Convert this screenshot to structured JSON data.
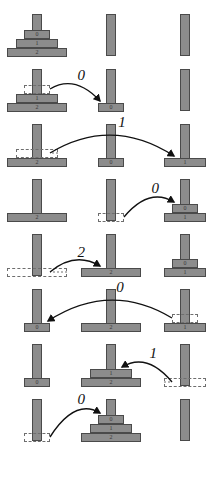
{
  "figure": {
    "peg_count": 3,
    "disc_count": 3,
    "disc_labels": [
      "0",
      "1",
      "2"
    ],
    "colors": {
      "disc_fill": "#8c8c8c",
      "disc_stroke": "#4a4a4a",
      "ghost_stroke": "#6e6e6e",
      "arrow": "#111111",
      "background": "#ffffff"
    }
  },
  "steps": [
    {
      "index": 0,
      "move_label": "",
      "pegs": [
        [
          "2",
          "1",
          "0"
        ],
        [],
        []
      ],
      "ghost": null,
      "arrow": null
    },
    {
      "index": 1,
      "move_label": "0",
      "pegs": [
        [
          "2",
          "1"
        ],
        [
          "0"
        ],
        []
      ],
      "ghost": {
        "peg": 0,
        "disc": "0",
        "level": 2
      },
      "arrow": {
        "from_peg": 0,
        "to_peg": 1,
        "label": "0"
      }
    },
    {
      "index": 2,
      "move_label": "1",
      "pegs": [
        [
          "2"
        ],
        [
          "0"
        ],
        [
          "1"
        ]
      ],
      "ghost": {
        "peg": 0,
        "disc": "1",
        "level": 1
      },
      "arrow": {
        "from_peg": 0,
        "to_peg": 2,
        "label": "1"
      }
    },
    {
      "index": 3,
      "move_label": "0",
      "pegs": [
        [
          "2"
        ],
        [],
        [
          "1",
          "0"
        ]
      ],
      "ghost": {
        "peg": 1,
        "disc": "0",
        "level": 0
      },
      "arrow": {
        "from_peg": 1,
        "to_peg": 2,
        "label": "0"
      }
    },
    {
      "index": 4,
      "move_label": "2",
      "pegs": [
        [],
        [
          "2"
        ],
        [
          "1",
          "0"
        ]
      ],
      "ghost": {
        "peg": 0,
        "disc": "2",
        "level": 0
      },
      "arrow": {
        "from_peg": 0,
        "to_peg": 1,
        "label": "2"
      }
    },
    {
      "index": 5,
      "move_label": "0",
      "pegs": [
        [
          "0"
        ],
        [
          "2"
        ],
        [
          "1"
        ]
      ],
      "ghost": {
        "peg": 2,
        "disc": "0",
        "level": 1
      },
      "arrow": {
        "from_peg": 2,
        "to_peg": 0,
        "label": "0"
      }
    },
    {
      "index": 6,
      "move_label": "1",
      "pegs": [
        [
          "0"
        ],
        [
          "2",
          "1"
        ],
        []
      ],
      "ghost": {
        "peg": 2,
        "disc": "1",
        "level": 0
      },
      "arrow": {
        "from_peg": 2,
        "to_peg": 1,
        "label": "1"
      }
    },
    {
      "index": 7,
      "move_label": "0",
      "pegs": [
        [],
        [
          "2",
          "1",
          "0"
        ],
        []
      ],
      "ghost": {
        "peg": 0,
        "disc": "0",
        "level": 0
      },
      "arrow": {
        "from_peg": 0,
        "to_peg": 1,
        "label": "0"
      }
    }
  ]
}
